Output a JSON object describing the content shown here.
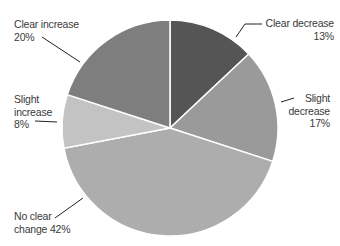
{
  "chart_data": {
    "type": "pie",
    "title": "",
    "start_angle_deg": 0,
    "direction": "clockwise",
    "slices": [
      {
        "label": "Clear decrease",
        "value": 13,
        "display": "13%",
        "color": "#555555"
      },
      {
        "label": "Slight decrease",
        "value": 17,
        "display": "17%",
        "color": "#9a9a9a"
      },
      {
        "label": "No clear change",
        "value": 42,
        "display": "42%",
        "color": "#adadad"
      },
      {
        "label": "Slight increase",
        "value": 8,
        "display": "8%",
        "color": "#c3c3c3"
      },
      {
        "label": "Clear increase",
        "value": 20,
        "display": "20%",
        "color": "#7e7e7e"
      }
    ],
    "legend": "none (leader-line labels)"
  },
  "labels": {
    "clear_decrease": {
      "line1": "Clear decrease",
      "line2": "13%"
    },
    "slight_decrease": {
      "line1": "Slight",
      "line2": "decrease",
      "line3": "17%"
    },
    "no_clear_change": {
      "line1": "No clear",
      "line2": "change 42%"
    },
    "slight_increase": {
      "line1": "Slight",
      "line2": "increase",
      "line3": "8%"
    },
    "clear_increase": {
      "line1": "Clear increase",
      "line2": "20%"
    }
  }
}
